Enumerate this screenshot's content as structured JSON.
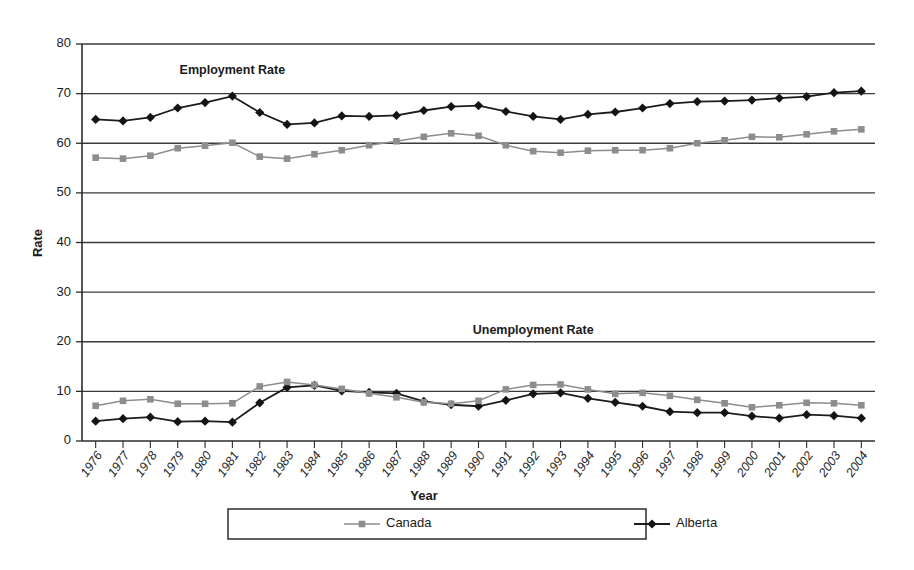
{
  "chart_data": {
    "type": "line",
    "title": "",
    "xlabel": "Year",
    "ylabel": "Rate",
    "ylim": [
      0,
      80
    ],
    "ytick_step": 10,
    "yticks": [
      0,
      10,
      20,
      30,
      40,
      50,
      60,
      70,
      80
    ],
    "grid": true,
    "grid_axis": "y",
    "legend_position": "bottom",
    "annotations": [
      {
        "text": "Employment Rate",
        "x": "1981",
        "y": 74
      },
      {
        "text": "Unemployment Rate",
        "x": "1992",
        "y": 21.5
      }
    ],
    "categories": [
      "1976",
      "1977",
      "1978",
      "1979",
      "1980",
      "1981",
      "1982",
      "1983",
      "1984",
      "1985",
      "1986",
      "1987",
      "1988",
      "1989",
      "1990",
      "1991",
      "1992",
      "1993",
      "1994",
      "1995",
      "1996",
      "1997",
      "1998",
      "1999",
      "2000",
      "2001",
      "2002",
      "2003",
      "2004"
    ],
    "groups": [
      {
        "name": "Employment Rate",
        "series": [
          {
            "name": "Alberta",
            "color": "#141414",
            "marker": "diamond",
            "values": [
              64.8,
              64.5,
              65.2,
              67.1,
              68.2,
              69.5,
              66.2,
              63.8,
              64.1,
              65.5,
              65.4,
              65.6,
              66.6,
              67.4,
              67.6,
              66.4,
              65.4,
              64.8,
              65.8,
              66.3,
              67.1,
              68.0,
              68.4,
              68.5,
              68.7,
              69.1,
              69.4,
              70.2,
              70.5
            ]
          },
          {
            "name": "Canada",
            "color": "#8d8d8d",
            "marker": "square",
            "values": [
              57.1,
              56.9,
              57.5,
              59.0,
              59.5,
              60.1,
              57.3,
              56.9,
              57.8,
              58.6,
              59.6,
              60.4,
              61.3,
              62.0,
              61.5,
              59.6,
              58.4,
              58.1,
              58.5,
              58.6,
              58.6,
              59.0,
              60.0,
              60.6,
              61.3,
              61.2,
              61.8,
              62.4,
              62.8
            ]
          }
        ]
      },
      {
        "name": "Unemployment Rate",
        "series": [
          {
            "name": "Alberta",
            "color": "#141414",
            "marker": "diamond",
            "values": [
              4.0,
              4.5,
              4.8,
              3.9,
              4.0,
              3.8,
              7.7,
              10.8,
              11.2,
              10.1,
              9.8,
              9.6,
              8.0,
              7.3,
              7.0,
              8.2,
              9.5,
              9.7,
              8.6,
              7.8,
              7.0,
              5.9,
              5.7,
              5.7,
              5.0,
              4.6,
              5.3,
              5.1,
              4.6
            ]
          },
          {
            "name": "Canada",
            "color": "#8d8d8d",
            "marker": "square",
            "values": [
              7.1,
              8.1,
              8.4,
              7.5,
              7.5,
              7.6,
              11.0,
              11.9,
              11.3,
              10.5,
              9.6,
              8.8,
              7.8,
              7.5,
              8.1,
              10.4,
              11.3,
              11.4,
              10.4,
              9.5,
              9.7,
              9.1,
              8.3,
              7.6,
              6.8,
              7.2,
              7.7,
              7.6,
              7.2
            ]
          }
        ]
      }
    ],
    "legend": [
      {
        "label": "Canada",
        "color": "#8d8d8d",
        "marker": "square"
      },
      {
        "label": "Alberta",
        "color": "#141414",
        "marker": "diamond"
      }
    ]
  }
}
